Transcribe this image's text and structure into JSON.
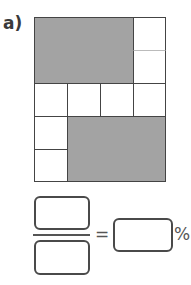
{
  "question": {
    "label": "a)",
    "grid": {
      "columns": 4,
      "rows": 5,
      "total_squares": 20,
      "shaded_squares": 10,
      "shaded_color": "#a3a3a3",
      "line_color": "#444444"
    },
    "answer": {
      "numerator_value": "",
      "denominator_value": "",
      "equals_sign": "=",
      "percent_value": "",
      "percent_sign": "%"
    }
  }
}
